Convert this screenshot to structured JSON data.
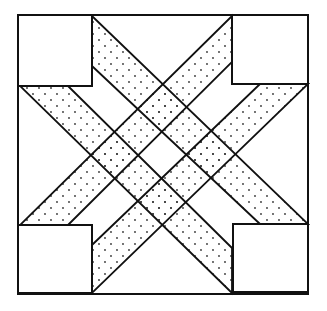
{
  "diagram": {
    "title": "",
    "stroke_color": "#111111",
    "fill_color": "#ffffff",
    "dot_color": "#333333",
    "outer_square": [
      18,
      15,
      308,
      294
    ],
    "corner_squares": [
      {
        "name": "top-left",
        "pts": [
          [
            18,
            15
          ],
          [
            92,
            15
          ],
          [
            92,
            86
          ],
          [
            18,
            86
          ]
        ]
      },
      {
        "name": "top-right",
        "pts": [
          [
            232,
            15
          ],
          [
            308,
            15
          ],
          [
            308,
            84
          ],
          [
            232,
            84
          ]
        ]
      },
      {
        "name": "bottom-left",
        "pts": [
          [
            18,
            225
          ],
          [
            92,
            225
          ],
          [
            92,
            293
          ],
          [
            18,
            293
          ]
        ]
      },
      {
        "name": "bottom-right",
        "pts": [
          [
            233,
            224
          ],
          [
            308,
            224
          ],
          [
            308,
            292
          ],
          [
            233,
            292
          ]
        ]
      }
    ],
    "bands": [
      {
        "name": "band-down-right-upper",
        "pts": [
          [
            92,
            16
          ],
          [
            308,
            224
          ],
          [
            260,
            224
          ],
          [
            92,
            66
          ]
        ]
      },
      {
        "name": "band-down-right-lower",
        "pts": [
          [
            20,
            86
          ],
          [
            68,
            86
          ],
          [
            232,
            248
          ],
          [
            232,
            293
          ]
        ]
      },
      {
        "name": "band-up-right-upper",
        "pts": [
          [
            232,
            16
          ],
          [
            232,
            62
          ],
          [
            68,
            225
          ],
          [
            20,
            225
          ]
        ]
      },
      {
        "name": "band-up-right-lower",
        "pts": [
          [
            308,
            84
          ],
          [
            260,
            84
          ],
          [
            92,
            245
          ],
          [
            92,
            293
          ]
        ]
      }
    ]
  }
}
